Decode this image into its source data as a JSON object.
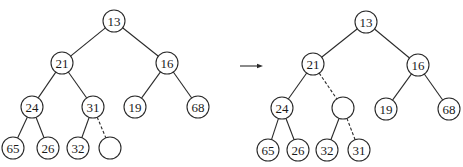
{
  "diagram": {
    "type": "binary-heap-percolate-up",
    "node_radius": 11,
    "colors": {
      "stroke": "#2a2a2a",
      "text": "#1a1a1a",
      "background": "#ffffff"
    },
    "trees": [
      {
        "name": "before",
        "nodes": [
          {
            "id": "n13",
            "label": "13",
            "x": 114,
            "y": 21
          },
          {
            "id": "n21",
            "label": "21",
            "x": 62,
            "y": 63
          },
          {
            "id": "n16",
            "label": "16",
            "x": 167,
            "y": 63
          },
          {
            "id": "n24",
            "label": "24",
            "x": 32,
            "y": 107
          },
          {
            "id": "n31",
            "label": "31",
            "x": 93,
            "y": 107
          },
          {
            "id": "n19",
            "label": "19",
            "x": 135,
            "y": 107
          },
          {
            "id": "n68",
            "label": "68",
            "x": 198,
            "y": 107
          },
          {
            "id": "n65",
            "label": "65",
            "x": 13,
            "y": 148
          },
          {
            "id": "n26",
            "label": "26",
            "x": 48,
            "y": 148
          },
          {
            "id": "n32",
            "label": "32",
            "x": 78,
            "y": 148
          },
          {
            "id": "hole",
            "label": "",
            "x": 110,
            "y": 148
          }
        ],
        "edges": [
          {
            "from": "n13",
            "to": "n21",
            "dashed": false
          },
          {
            "from": "n13",
            "to": "n16",
            "dashed": false
          },
          {
            "from": "n21",
            "to": "n24",
            "dashed": false
          },
          {
            "from": "n21",
            "to": "n31",
            "dashed": false
          },
          {
            "from": "n16",
            "to": "n19",
            "dashed": false
          },
          {
            "from": "n16",
            "to": "n68",
            "dashed": false
          },
          {
            "from": "n24",
            "to": "n65",
            "dashed": false
          },
          {
            "from": "n24",
            "to": "n26",
            "dashed": false
          },
          {
            "from": "n31",
            "to": "n32",
            "dashed": false
          },
          {
            "from": "n31",
            "to": "hole",
            "dashed": true
          }
        ]
      },
      {
        "name": "after",
        "nodes": [
          {
            "id": "n13",
            "label": "13",
            "x": 366,
            "y": 22
          },
          {
            "id": "n21",
            "label": "21",
            "x": 313,
            "y": 64
          },
          {
            "id": "n16",
            "label": "16",
            "x": 418,
            "y": 65
          },
          {
            "id": "n24",
            "label": "24",
            "x": 282,
            "y": 108
          },
          {
            "id": "hole",
            "label": "",
            "x": 343,
            "y": 108
          },
          {
            "id": "n19",
            "label": "19",
            "x": 386,
            "y": 109
          },
          {
            "id": "n68",
            "label": "68",
            "x": 449,
            "y": 109
          },
          {
            "id": "n65",
            "label": "65",
            "x": 268,
            "y": 150
          },
          {
            "id": "n26",
            "label": "26",
            "x": 298,
            "y": 150
          },
          {
            "id": "n32",
            "label": "32",
            "x": 327,
            "y": 150
          },
          {
            "id": "n31",
            "label": "31",
            "x": 359,
            "y": 150
          }
        ],
        "edges": [
          {
            "from": "n13",
            "to": "n21",
            "dashed": false
          },
          {
            "from": "n13",
            "to": "n16",
            "dashed": false
          },
          {
            "from": "n21",
            "to": "n24",
            "dashed": false
          },
          {
            "from": "n21",
            "to": "hole",
            "dashed": true
          },
          {
            "from": "n16",
            "to": "n19",
            "dashed": false
          },
          {
            "from": "n16",
            "to": "n68",
            "dashed": false
          },
          {
            "from": "n24",
            "to": "n65",
            "dashed": false
          },
          {
            "from": "n24",
            "to": "n26",
            "dashed": false
          },
          {
            "from": "hole",
            "to": "n32",
            "dashed": false
          },
          {
            "from": "hole",
            "to": "n31",
            "dashed": true
          }
        ]
      }
    ],
    "arrow": {
      "x1": 240,
      "y1": 66,
      "x2": 263,
      "y2": 66
    }
  }
}
